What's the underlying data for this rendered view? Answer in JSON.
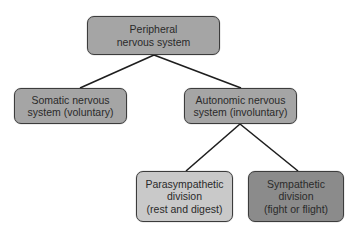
{
  "diagram": {
    "type": "hierarchy-tree",
    "colors": {
      "medium": "#a5a5a5",
      "light": "#c9c9c9",
      "dark": "#8b8b8b",
      "line": "#1e1e1e",
      "background": "#ffffff"
    },
    "nodes": {
      "root": {
        "lines": [
          "Peripheral",
          "nervous system"
        ]
      },
      "somatic": {
        "lines": [
          "Somatic nervous",
          "system (voluntary)"
        ]
      },
      "autonomic": {
        "lines": [
          "Autonomic nervous",
          "system (involuntary)"
        ]
      },
      "parasympathetic": {
        "lines": [
          "Parasympathetic",
          "division",
          "(rest and digest)"
        ]
      },
      "sympathetic": {
        "lines": [
          "Sympathetic",
          "division",
          "(fight or flight)"
        ]
      }
    },
    "edges": [
      {
        "from": "root",
        "to": "somatic"
      },
      {
        "from": "root",
        "to": "autonomic"
      },
      {
        "from": "autonomic",
        "to": "parasympathetic"
      },
      {
        "from": "autonomic",
        "to": "sympathetic"
      }
    ]
  }
}
